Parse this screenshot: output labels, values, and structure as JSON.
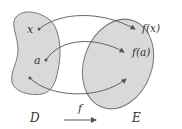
{
  "diagram": {
    "domain_set": {
      "label": "D",
      "points": [
        "x",
        "a",
        ""
      ]
    },
    "codomain_set": {
      "label": "E",
      "points": [
        "f(x)",
        "f(a)",
        ""
      ]
    },
    "mapping": {
      "label": "f"
    },
    "colors": {
      "set_fill": "#d9d9d9",
      "set_stroke": "#777777",
      "arrow": "#555555"
    }
  }
}
